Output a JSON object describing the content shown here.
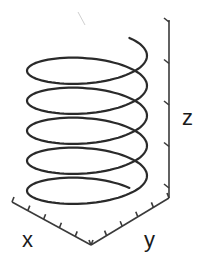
{
  "figure": {
    "title": "",
    "stroke_color": "#2a2a2a",
    "background": "#ffffff"
  },
  "axes": {
    "x": {
      "label": "x",
      "ticks": 6
    },
    "y": {
      "label": "y",
      "ticks": 6
    },
    "z": {
      "label": "z",
      "ticks": 5
    }
  },
  "helix": {
    "turns": 5,
    "center_x": 87,
    "radius_x": 60,
    "radius_y": 20,
    "top_y": 52,
    "pitch_px": 30
  }
}
